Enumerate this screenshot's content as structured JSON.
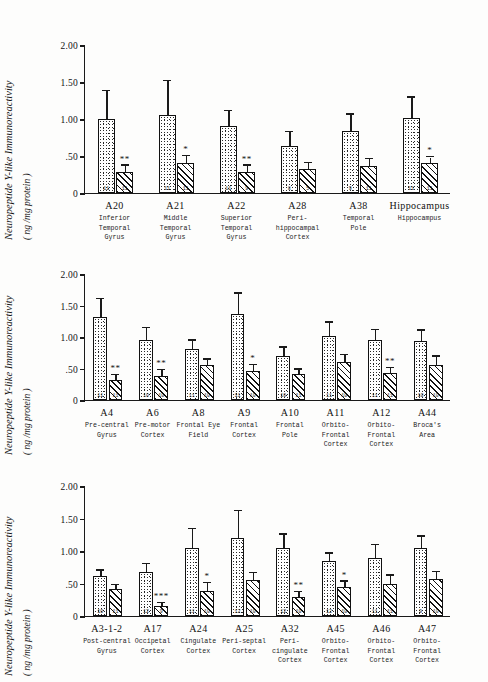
{
  "figure": {
    "axis_title_line1": "Neuropeptide Y-like  Immunoreactivity",
    "axis_title_line2": "( ng /mg protein )",
    "y_ticks": [
      "2.00",
      "1.50",
      "1.00",
      ".50",
      "0"
    ],
    "y_tick_values": [
      2.0,
      1.5,
      1.0,
      0.5,
      0.0
    ],
    "ylim": [
      0,
      2.0
    ],
    "series_names": [
      "Control",
      "Alzheimer"
    ],
    "fill_control": "stipple",
    "fill_patient": "hatch"
  },
  "chart_data": [
    {
      "type": "bar",
      "panel": 1,
      "title": "",
      "xlabel": "",
      "ylabel": "Neuropeptide Y-like Immunoreactivity (ng/mg protein)",
      "ylim": [
        0,
        2.0
      ],
      "yticks": [
        0,
        0.5,
        1.0,
        1.5,
        2.0
      ],
      "grid": false,
      "legend": "none",
      "categories": [
        "A20",
        "A21",
        "A22",
        "A28",
        "A38",
        "Hippocampus"
      ],
      "category_descriptions": [
        "Inferior\nTemporal\nGyrus",
        "Middle\nTemporal\nGyrus",
        "Superior\nTemporal\nGyrus",
        "Peri-\nhippocampal\nCortex",
        "Temporal\nPole",
        "Hippocampus"
      ],
      "series": [
        {
          "name": "Control",
          "values": [
            1.0,
            1.06,
            0.91,
            0.63,
            0.84,
            1.02
          ],
          "errors": [
            0.38,
            0.45,
            0.2,
            0.19,
            0.22,
            0.27
          ],
          "n": [
            "11",
            "11",
            "11",
            "8",
            "9",
            "11"
          ]
        },
        {
          "name": "Alzheimer",
          "values": [
            0.29,
            0.41,
            0.28,
            0.32,
            0.37,
            0.4
          ],
          "errors": [
            0.08,
            0.09,
            0.09,
            0.08,
            0.09,
            0.08
          ],
          "n": [
            "11",
            "11",
            "9",
            "5",
            "11",
            "11"
          ],
          "significance": [
            "**",
            "*",
            "**",
            "",
            "",
            "*"
          ]
        }
      ]
    },
    {
      "type": "bar",
      "panel": 2,
      "title": "",
      "xlabel": "",
      "ylabel": "Neuropeptide Y-like Immunoreactivity (ng/mg protein)",
      "ylim": [
        0,
        2.0
      ],
      "yticks": [
        0,
        0.5,
        1.0,
        1.5,
        2.0
      ],
      "grid": false,
      "legend": "none",
      "categories": [
        "A4",
        "A6",
        "A8",
        "A9",
        "A10",
        "A11",
        "A12",
        "A44"
      ],
      "category_descriptions": [
        "Pre-central\nGyrus",
        "Pre-motor\nCortex",
        "Frontal Eye\nField",
        "Frontal\nCortex",
        "Frontal\nPole",
        "Orbito-\nFrontal\nCortex",
        "Orbito-\nFrontal\nCortex",
        "Broca's\nArea"
      ],
      "series": [
        {
          "name": "Control",
          "values": [
            1.31,
            0.95,
            0.81,
            1.37,
            0.7,
            1.02,
            0.96,
            0.94
          ],
          "errors": [
            0.29,
            0.19,
            0.13,
            0.32,
            0.13,
            0.21,
            0.15,
            0.16
          ],
          "n": [
            "11",
            "10",
            "11",
            "11",
            "10",
            "11",
            "11",
            "10"
          ]
        },
        {
          "name": "Alzheimer",
          "values": [
            0.31,
            0.38,
            0.55,
            0.46,
            0.41,
            0.6,
            0.43,
            0.56
          ],
          "errors": [
            0.09,
            0.09,
            0.09,
            0.09,
            0.07,
            0.11,
            0.08,
            0.13
          ],
          "n": [
            "11",
            "10",
            "10",
            "10",
            "11",
            "10",
            "11",
            "10"
          ],
          "significance": [
            "**",
            "**",
            "",
            "*",
            "",
            "",
            "**",
            ""
          ]
        }
      ]
    },
    {
      "type": "bar",
      "panel": 3,
      "title": "",
      "xlabel": "",
      "ylabel": "Neuropeptide Y-like Immunoreactivity (ng/mg protein)",
      "ylim": [
        0,
        2.0
      ],
      "yticks": [
        0,
        0.5,
        1.0,
        1.5,
        2.0
      ],
      "grid": false,
      "legend": "none",
      "categories": [
        "A3-1-2",
        "A17",
        "A24",
        "A25",
        "A32",
        "A45",
        "A46",
        "A47"
      ],
      "category_descriptions": [
        "Post-central\nGyrus",
        "Occipetal\nCortex",
        "Cingulate\nCortex",
        "Peri-septal\nCortex",
        "Peri-\ncingulate\nCortex",
        "Orbito-\nFrontal\nCortex",
        "Orbito-\nFrontal\nCortex",
        "Orbito-\nFrontal\nCortex"
      ],
      "series": [
        {
          "name": "Control",
          "values": [
            0.61,
            0.67,
            1.05,
            1.2,
            1.04,
            0.85,
            0.9,
            1.05
          ],
          "errors": [
            0.09,
            0.13,
            0.29,
            0.41,
            0.21,
            0.11,
            0.19,
            0.17
          ],
          "n": [
            "10",
            "12",
            "11",
            "12",
            "12",
            "12",
            "11",
            "9"
          ]
        },
        {
          "name": "Alzheimer",
          "values": [
            0.41,
            0.15,
            0.38,
            0.55,
            0.3,
            0.44,
            0.5,
            0.57
          ],
          "errors": [
            0.06,
            0.05,
            0.13,
            0.11,
            0.07,
            0.09,
            0.12,
            0.11
          ],
          "n": [
            "11",
            "9",
            "10",
            "10",
            "10",
            "10",
            "11",
            "10"
          ],
          "significance": [
            "",
            "***",
            "*",
            "",
            "**",
            "*",
            "",
            ""
          ]
        }
      ]
    }
  ]
}
